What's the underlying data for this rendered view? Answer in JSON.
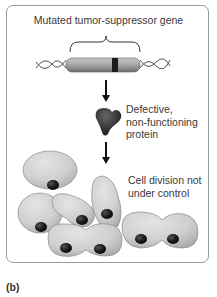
{
  "diagram": {
    "gene_label": "Mutated tumor-suppressor gene",
    "protein_label_lines": [
      "Defective,",
      "non-functioning",
      "protein"
    ],
    "cell_label_lines": [
      "Cell division not",
      "under control"
    ],
    "figure_label": "(b)"
  },
  "colors": {
    "frame_border": "#9a9a9a",
    "text": "#3a3a3a",
    "cell_fill": "#cfcfcf",
    "nucleus": "#1a1a1a",
    "gene_bar": "#9c9c9c"
  }
}
